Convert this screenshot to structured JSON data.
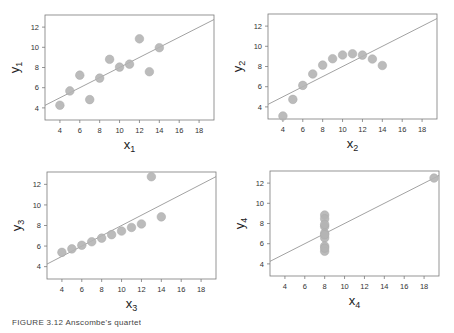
{
  "figure": {
    "caption": "FIGURE 3.12  Anscombe's quartet"
  },
  "chart_data": [
    {
      "type": "scatter",
      "title": "",
      "xlabel": "x1",
      "ylabel": "y1",
      "xlabel_main": "x",
      "xlabel_sub": "1",
      "ylabel_main": "y",
      "ylabel_sub": "1",
      "xlim": [
        2.5,
        19.5
      ],
      "ylim": [
        2.8,
        13.2
      ],
      "xticks": [
        4,
        6,
        8,
        10,
        12,
        14,
        16,
        18
      ],
      "yticks": [
        4,
        6,
        8,
        10,
        12
      ],
      "x": [
        10,
        8,
        13,
        9,
        11,
        14,
        6,
        4,
        12,
        7,
        5
      ],
      "y": [
        8.04,
        6.95,
        7.58,
        8.81,
        8.33,
        9.96,
        7.24,
        4.26,
        10.84,
        4.82,
        5.68
      ],
      "fit_line": {
        "intercept": 3.0,
        "slope": 0.5
      },
      "grid": false
    },
    {
      "type": "scatter",
      "title": "",
      "xlabel": "x2",
      "ylabel": "y2",
      "xlabel_main": "x",
      "xlabel_sub": "2",
      "ylabel_main": "y",
      "ylabel_sub": "2",
      "xlim": [
        2.5,
        19.5
      ],
      "ylim": [
        2.8,
        13.2
      ],
      "xticks": [
        4,
        6,
        8,
        10,
        12,
        14,
        16,
        18
      ],
      "yticks": [
        4,
        6,
        8,
        10,
        12
      ],
      "x": [
        10,
        8,
        13,
        9,
        11,
        14,
        6,
        4,
        12,
        7,
        5
      ],
      "y": [
        9.14,
        8.14,
        8.74,
        8.77,
        9.26,
        8.1,
        6.13,
        3.1,
        9.13,
        7.26,
        4.74
      ],
      "fit_line": {
        "intercept": 3.0,
        "slope": 0.5
      },
      "grid": false
    },
    {
      "type": "scatter",
      "title": "",
      "xlabel": "x3",
      "ylabel": "y3",
      "xlabel_main": "x",
      "xlabel_sub": "3",
      "ylabel_main": "y",
      "ylabel_sub": "3",
      "xlim": [
        2.5,
        19.5
      ],
      "ylim": [
        2.8,
        13.2
      ],
      "xticks": [
        4,
        6,
        8,
        10,
        12,
        14,
        16,
        18
      ],
      "yticks": [
        4,
        6,
        8,
        10,
        12
      ],
      "x": [
        10,
        8,
        13,
        9,
        11,
        14,
        6,
        4,
        12,
        7,
        5
      ],
      "y": [
        7.46,
        6.77,
        12.74,
        7.11,
        7.81,
        8.84,
        6.08,
        5.39,
        8.15,
        6.42,
        5.73
      ],
      "fit_line": {
        "intercept": 3.0,
        "slope": 0.5
      },
      "grid": false
    },
    {
      "type": "scatter",
      "title": "",
      "xlabel": "x4",
      "ylabel": "y4",
      "xlabel_main": "x",
      "xlabel_sub": "4",
      "ylabel_main": "y",
      "ylabel_sub": "4",
      "xlim": [
        2.5,
        19.5
      ],
      "ylim": [
        2.8,
        13.2
      ],
      "xticks": [
        4,
        6,
        8,
        10,
        12,
        14,
        16,
        18
      ],
      "yticks": [
        4,
        6,
        8,
        10,
        12
      ],
      "x": [
        8,
        8,
        8,
        8,
        8,
        8,
        8,
        19,
        8,
        8,
        8
      ],
      "y": [
        6.58,
        5.76,
        7.71,
        8.84,
        8.47,
        7.04,
        5.25,
        12.5,
        5.56,
        7.91,
        6.89
      ],
      "fit_line": {
        "intercept": 3.0,
        "slope": 0.5
      },
      "grid": false
    }
  ],
  "colors": {
    "point_fill": "#b4b4b4",
    "point_stroke": "#a8a8a8",
    "fit_line": "#8a8a8a",
    "axis": "#7a7a7a",
    "tick_label": "#333333",
    "axis_label": "#222222"
  },
  "panels": [
    {
      "box": [
        45,
        15,
        214,
        120
      ]
    },
    {
      "box": [
        268,
        14,
        437,
        119
      ]
    },
    {
      "box": [
        47,
        172,
        216,
        279
      ]
    },
    {
      "box": [
        270,
        171,
        439,
        276
      ]
    }
  ]
}
